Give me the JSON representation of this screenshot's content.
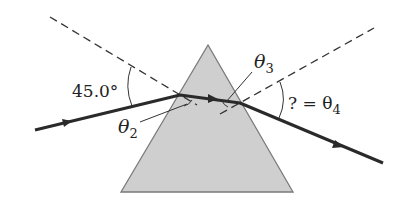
{
  "diagram": {
    "type": "prism-refraction",
    "colors": {
      "prism_fill": "#cfcfcf",
      "prism_edge": "#7a7a7a",
      "ray": "#2a2a2a",
      "normal": "#333333"
    },
    "labels": {
      "incident_angle": "45.0°",
      "theta2": "θ",
      "theta2_sub": "2",
      "theta3": "θ",
      "theta3_sub": "3",
      "theta4_prefix": "? = θ",
      "theta4_sub": "4"
    }
  }
}
